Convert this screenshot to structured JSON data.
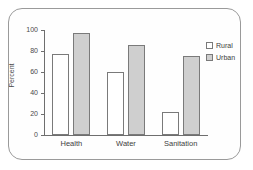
{
  "chart_data": {
    "type": "bar",
    "title": "",
    "xlabel": "",
    "ylabel": "Percent",
    "ylim": [
      0,
      100
    ],
    "yticks": [
      0,
      20,
      40,
      60,
      80,
      100
    ],
    "ytick_labels": [
      "0",
      "20",
      "40",
      "60",
      "80",
      "100"
    ],
    "grid": false,
    "legend_position": "top-right",
    "categories": [
      "Health",
      "Water",
      "Sanitation"
    ],
    "series": [
      {
        "name": "Rural",
        "color": "#ffffff",
        "edge_color": "#7a7a7a",
        "values": [
          77,
          60,
          22
        ]
      },
      {
        "name": "Urban",
        "color": "#cfcfcf",
        "edge_color": "#7a7a7a",
        "values": [
          97,
          86,
          75
        ]
      }
    ]
  },
  "legend": {
    "items": [
      {
        "label": "Rural",
        "swatch": "rural-swatch"
      },
      {
        "label": "Urban",
        "swatch": "urban-swatch"
      }
    ]
  },
  "frame": {
    "border_color": "#9a9a9a",
    "background": "#ffffff"
  }
}
